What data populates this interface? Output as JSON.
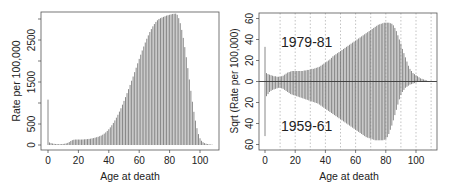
{
  "chart_data": [
    {
      "type": "bar",
      "title": "",
      "xlabel": "Age at death",
      "ylabel": "Rate per 100,000",
      "xlim": [
        -4,
        112
      ],
      "ylim": [
        -120,
        3150
      ],
      "x_ticks": [
        0,
        20,
        40,
        60,
        80,
        100
      ],
      "y_ticks": [
        0,
        500,
        1500,
        2500
      ],
      "grid": false,
      "legend": null,
      "x": [
        0,
        1,
        2,
        3,
        4,
        5,
        6,
        7,
        8,
        9,
        10,
        11,
        12,
        13,
        14,
        15,
        16,
        17,
        18,
        19,
        20,
        21,
        22,
        23,
        24,
        25,
        26,
        27,
        28,
        29,
        30,
        31,
        32,
        33,
        34,
        35,
        36,
        37,
        38,
        39,
        40,
        41,
        42,
        43,
        44,
        45,
        46,
        47,
        48,
        49,
        50,
        51,
        52,
        53,
        54,
        55,
        56,
        57,
        58,
        59,
        60,
        61,
        62,
        63,
        64,
        65,
        66,
        67,
        68,
        69,
        70,
        71,
        72,
        73,
        74,
        75,
        76,
        77,
        78,
        79,
        80,
        81,
        82,
        83,
        84,
        85,
        86,
        87,
        88,
        89,
        90,
        91,
        92,
        93,
        94,
        95,
        96,
        97,
        98,
        99,
        100,
        101,
        102,
        103,
        104,
        105,
        106,
        107,
        108
      ],
      "values": [
        1080,
        60,
        45,
        35,
        28,
        24,
        22,
        20,
        20,
        22,
        25,
        30,
        38,
        50,
        70,
        95,
        115,
        125,
        130,
        130,
        130,
        130,
        130,
        132,
        135,
        138,
        140,
        145,
        150,
        158,
        165,
        175,
        185,
        195,
        210,
        225,
        245,
        270,
        300,
        335,
        375,
        420,
        470,
        525,
        585,
        650,
        720,
        795,
        875,
        960,
        1050,
        1140,
        1235,
        1330,
        1430,
        1530,
        1630,
        1735,
        1840,
        1945,
        2050,
        2150,
        2250,
        2345,
        2440,
        2530,
        2610,
        2690,
        2760,
        2825,
        2880,
        2930,
        2970,
        3000,
        3020,
        3035,
        3050,
        3065,
        3080,
        3090,
        3100,
        3110,
        3120,
        3125,
        3128,
        3100,
        3020,
        2900,
        2740,
        2550,
        2330,
        2090,
        1830,
        1560,
        1290,
        1030,
        790,
        580,
        400,
        260,
        160,
        100,
        65,
        45,
        30,
        22,
        16,
        12,
        8
      ]
    },
    {
      "type": "bar",
      "title": "",
      "xlabel": "Age at death",
      "ylabel": "Sqrt (Rate per 100,000)",
      "xlim": [
        -4,
        112
      ],
      "ylim": [
        -62,
        62
      ],
      "x_ticks": [
        0,
        20,
        40,
        60,
        80,
        100
      ],
      "y_ticks": [
        60,
        40,
        20,
        0,
        20,
        40,
        60
      ],
      "grid": "vertical dotted lines every 10 years",
      "annotations": [
        "1979-81",
        "1959-61"
      ],
      "series": [
        {
          "name": "1979-81",
          "direction": "up",
          "x": [
            0,
            1,
            2,
            3,
            4,
            5,
            6,
            7,
            8,
            9,
            10,
            11,
            12,
            13,
            14,
            15,
            16,
            17,
            18,
            19,
            20,
            21,
            22,
            23,
            24,
            25,
            26,
            27,
            28,
            29,
            30,
            31,
            32,
            33,
            34,
            35,
            36,
            37,
            38,
            39,
            40,
            41,
            42,
            43,
            44,
            45,
            46,
            47,
            48,
            49,
            50,
            51,
            52,
            53,
            54,
            55,
            56,
            57,
            58,
            59,
            60,
            61,
            62,
            63,
            64,
            65,
            66,
            67,
            68,
            69,
            70,
            71,
            72,
            73,
            74,
            75,
            76,
            77,
            78,
            79,
            80,
            81,
            82,
            83,
            84,
            85,
            86,
            87,
            88,
            89,
            90,
            91,
            92,
            93,
            94,
            95,
            96,
            97,
            98,
            99,
            100,
            101,
            102,
            103,
            104,
            105,
            106,
            107,
            108
          ],
          "values": [
            33,
            8,
            7,
            6.5,
            6,
            5.5,
            5,
            5,
            4.5,
            4.5,
            4.5,
            5,
            5.5,
            6.5,
            7.5,
            8.5,
            9,
            9.5,
            10,
            10,
            10,
            10,
            10,
            10,
            10,
            10,
            10.5,
            10.5,
            11,
            11,
            11.5,
            12,
            12,
            12.5,
            13,
            13.5,
            14,
            15,
            16,
            17,
            18,
            19,
            20,
            21,
            22.5,
            24,
            25,
            26,
            27,
            28,
            29,
            30,
            31,
            32,
            33,
            34,
            35,
            36,
            37,
            38,
            39,
            40,
            41,
            42,
            43,
            44,
            45,
            46,
            47,
            48,
            49,
            50,
            51,
            52,
            53,
            54,
            54.5,
            55,
            55.5,
            56,
            56,
            56,
            56,
            55.5,
            55,
            53.5,
            51,
            48,
            44,
            40,
            36,
            31,
            27,
            23,
            19,
            15,
            12,
            10,
            8,
            7,
            6,
            5,
            4,
            3,
            2.5,
            2,
            1.5,
            1,
            0.5
          ]
        },
        {
          "name": "1959-61",
          "direction": "down",
          "x": [
            0,
            1,
            2,
            3,
            4,
            5,
            6,
            7,
            8,
            9,
            10,
            11,
            12,
            13,
            14,
            15,
            16,
            17,
            18,
            19,
            20,
            21,
            22,
            23,
            24,
            25,
            26,
            27,
            28,
            29,
            30,
            31,
            32,
            33,
            34,
            35,
            36,
            37,
            38,
            39,
            40,
            41,
            42,
            43,
            44,
            45,
            46,
            47,
            48,
            49,
            50,
            51,
            52,
            53,
            54,
            55,
            56,
            57,
            58,
            59,
            60,
            61,
            62,
            63,
            64,
            65,
            66,
            67,
            68,
            69,
            70,
            71,
            72,
            73,
            74,
            75,
            76,
            77,
            78,
            79,
            80,
            81,
            82,
            83,
            84,
            85,
            86,
            87,
            88,
            89,
            90,
            91,
            92,
            93,
            94,
            95,
            96,
            97,
            98,
            99,
            100,
            101,
            102,
            103,
            104,
            105,
            106,
            107,
            108
          ],
          "values": [
            52,
            14,
            12,
            10,
            9,
            8,
            7.5,
            7,
            6.5,
            6,
            6,
            6.5,
            7,
            8,
            9,
            10,
            11,
            12,
            12.5,
            13,
            13.5,
            14,
            14.5,
            15,
            15.5,
            16,
            16.5,
            17,
            17.5,
            18,
            18.5,
            19,
            19.5,
            20,
            20.5,
            21,
            22,
            23,
            24,
            25,
            26,
            27,
            28,
            29,
            30,
            31,
            32,
            33,
            34,
            35,
            36,
            37,
            38,
            39,
            40,
            41,
            42,
            43,
            44,
            45,
            46,
            47,
            48,
            49,
            50,
            51,
            52,
            53,
            53.5,
            54,
            54.5,
            55,
            55.5,
            56,
            56,
            56,
            56,
            56,
            56,
            55.5,
            55,
            53,
            50,
            46,
            42,
            37,
            32,
            27,
            22,
            17,
            13,
            10,
            8,
            6,
            5,
            4,
            3,
            2.5,
            2,
            1.5,
            1,
            0.5,
            0.3,
            0.2,
            0.1,
            0.1,
            0.1,
            0.1,
            0.1
          ]
        }
      ]
    }
  ],
  "panels": {
    "left": {
      "ylabel": "Rate per 100,000",
      "xlabel": "Age at death",
      "x_tick_labels": [
        "0",
        "20",
        "40",
        "60",
        "80",
        "100"
      ],
      "y_tick_labels": [
        "0",
        "500",
        "1500",
        "2500"
      ]
    },
    "right": {
      "ylabel": "Sqrt (Rate per 100,000)",
      "xlabel": "Age at death",
      "x_tick_labels": [
        "0",
        "20",
        "40",
        "60",
        "80",
        "100"
      ],
      "y_tick_labels_top": [
        "0",
        "20",
        "40",
        "60"
      ],
      "y_tick_labels_bottom": [
        "20",
        "40",
        "60"
      ],
      "label_top": "1979-81",
      "label_bottom": "1959-61"
    }
  },
  "colors": {
    "bar": "#7a7a7a",
    "axis": "#444444",
    "grid": "#9a9a9a",
    "text": "#222222"
  }
}
